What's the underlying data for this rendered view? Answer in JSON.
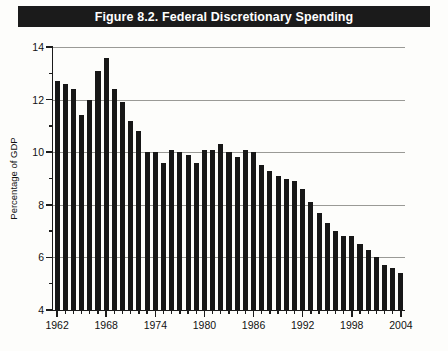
{
  "figure": {
    "title": "Figure 8.2. Federal Discretionary Spending",
    "title_bar_color": "#1b1b1b",
    "bar_color": "#171717",
    "grid_color": "#9a9a96",
    "background_color": "#fdfdfb"
  },
  "chart_data": {
    "type": "bar",
    "title": "Figure 8.2. Federal Discretionary Spending",
    "xlabel": "",
    "ylabel": "Percentage of GDP",
    "ylim": [
      4,
      14
    ],
    "ytick_major": [
      4,
      6,
      8,
      10,
      12,
      14
    ],
    "ytick_minor": [
      5,
      7,
      9,
      11,
      13
    ],
    "xlim": [
      1962,
      2004
    ],
    "xtick_labels": [
      "1962",
      "1968",
      "1974",
      "1980",
      "1986",
      "1992",
      "1998",
      "2004"
    ],
    "xtick_values": [
      1962,
      1968,
      1974,
      1980,
      1986,
      1992,
      1998,
      2004
    ],
    "grid": true,
    "grid_axis": "y",
    "legend": null,
    "categories": [
      "1962",
      "1963",
      "1964",
      "1965",
      "1966",
      "1967",
      "1968",
      "1969",
      "1970",
      "1971",
      "1972",
      "1973",
      "1974",
      "1975",
      "1976",
      "1977",
      "1978",
      "1979",
      "1980",
      "1981",
      "1982",
      "1983",
      "1984",
      "1985",
      "1986",
      "1987",
      "1988",
      "1989",
      "1990",
      "1991",
      "1992",
      "1993",
      "1994",
      "1995",
      "1996",
      "1997",
      "1998",
      "1999",
      "2000",
      "2001",
      "2002",
      "2003",
      "2004"
    ],
    "values": [
      12.7,
      12.6,
      12.4,
      11.4,
      12.0,
      13.1,
      13.6,
      12.4,
      11.9,
      11.2,
      10.8,
      10.0,
      10.0,
      9.6,
      10.1,
      10.0,
      9.9,
      9.6,
      10.1,
      10.1,
      10.3,
      10.0,
      9.8,
      10.1,
      10.0,
      9.5,
      9.3,
      9.1,
      9.0,
      8.9,
      8.6,
      8.1,
      7.7,
      7.3,
      7.0,
      6.8,
      6.8,
      6.5,
      6.3,
      6.0,
      5.7,
      5.6,
      5.4
    ]
  }
}
